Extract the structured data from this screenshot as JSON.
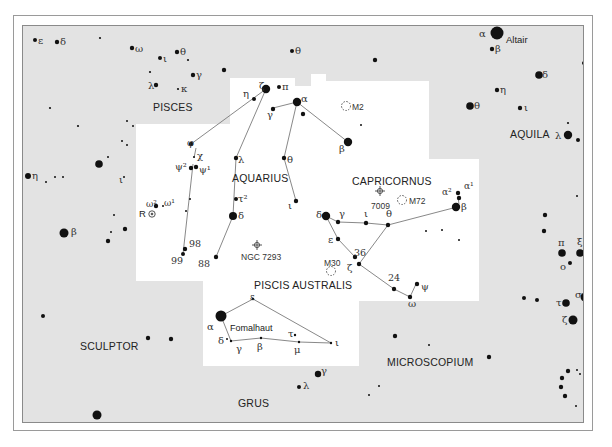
{
  "map": {
    "type": "star chart",
    "colors": {
      "background_other": "#e3e3e3",
      "highlight_region": "#ffffff",
      "star": "#111111",
      "lines": "#777777",
      "border": "#8a8a8a"
    }
  },
  "constellations": {
    "pisces": "PISCES",
    "aquila": "AQUILA",
    "aquarius": "AQUARIUS",
    "capricornus": "CAPRICORNUS",
    "piscis_australis": "PISCIS AUSTRALIS",
    "sculptor": "SCULPTOR",
    "microscopium": "MICROSCOPIUM",
    "grus": "GRUS"
  },
  "named_stars": {
    "altair": "Altair",
    "fomalhaut": "Fomalhaut"
  },
  "deep_sky": {
    "m2": "M2",
    "m72": "M72",
    "m30": "M30",
    "ngc7009": "7009",
    "ngc7293": "NGC 7293",
    "r_aqr": "R"
  },
  "greek": {
    "pisces": {
      "epsilon": "ε",
      "delta": "δ",
      "omega": "ω",
      "iota": "ι",
      "theta": "θ",
      "gamma": "γ",
      "lambda": "λ",
      "kappa": "κ"
    },
    "pegasus_theta": "θ",
    "aquila": {
      "alpha": "α",
      "beta": "β",
      "delta": "δ",
      "eta": "η",
      "theta": "θ",
      "iota": "ι",
      "lambda": "λ"
    },
    "aquarius": {
      "eta": "η",
      "zeta": "ζ",
      "pi": "π",
      "alpha": "α",
      "gamma": "γ",
      "beta": "β",
      "phi": "φ",
      "chi": "χ",
      "psi2": "ψ²",
      "psi1": "ψ¹",
      "lambda": "λ",
      "theta": "θ",
      "iota": "ι",
      "tau2": "τ²",
      "delta": "δ",
      "omega2": "ω²",
      "omega1": "ω¹",
      "n98": "98",
      "n99": "99",
      "n88": "88"
    },
    "capricornus": {
      "delta": "δ",
      "gamma": "γ",
      "iota": "ι",
      "theta": "θ",
      "alpha2": "α²",
      "alpha1": "α¹",
      "beta": "β",
      "epsilon": "ε",
      "n36": "36",
      "zeta": "ζ",
      "n24": "24",
      "psi": "ψ",
      "omega": "ω"
    },
    "piscis_australis": {
      "alpha": "α",
      "epsilon": "ε",
      "delta": "δ",
      "gamma": "γ",
      "beta": "β",
      "tau": "τ",
      "mu": "μ",
      "iota": "ι"
    },
    "cetus_eta": "η",
    "sculptor_beta": "β",
    "sculptor_iota": "ι",
    "sagittarius": {
      "pi": "π",
      "xi": "ξ",
      "omicron": "ο",
      "sigma": "σ",
      "tau": "τ",
      "zeta": "ζ"
    },
    "grus": {
      "gamma": "γ",
      "lambda": "λ"
    }
  }
}
